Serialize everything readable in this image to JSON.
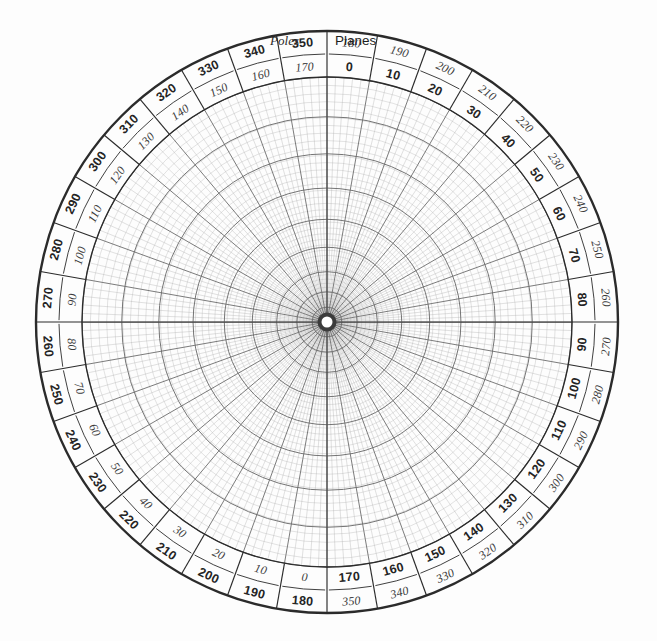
{
  "figure": {
    "kind": "polar-stereographic-net",
    "title_left": "Poles",
    "title_right": "Planes",
    "background_color": "#fdfdfd",
    "ink_color": "#2b2b2b",
    "grid_color": "#6e6e6e",
    "grid_fine_color": "#a8a8a8"
  },
  "geometry": {
    "center_x": 327,
    "center_y": 322,
    "outer_radius": 291,
    "band_inner_radius": 245,
    "hub_radius": 7,
    "label_band_width": 46
  },
  "chart_data": {
    "type": "polar-grid",
    "subtitle": "",
    "xlabel": "",
    "ylabel": "",
    "grid": true,
    "legend_position": "top",
    "scales": [
      {
        "name": "Planes",
        "style": "upright",
        "zero_at_degrees": 0,
        "direction": "clockwise",
        "tick_step": 10,
        "range": [
          0,
          350
        ]
      },
      {
        "name": "Poles",
        "style": "italic",
        "zero_at_degrees": 180,
        "direction": "clockwise",
        "tick_step": 10,
        "range": [
          0,
          350
        ]
      }
    ],
    "radial_lines": {
      "fine_step_degrees": 2,
      "major_step_degrees": 10,
      "count_fine": 180,
      "count_major": 36
    },
    "concentric_circles": {
      "fine_count": 44,
      "major_count": 9,
      "outer_circle_radius": 291,
      "grid_outer_radius": 245
    },
    "tick_labels": [
      {
        "azimuth": 0,
        "planes": "0",
        "poles": "180"
      },
      {
        "azimuth": 10,
        "planes": "10",
        "poles": "190"
      },
      {
        "azimuth": 20,
        "planes": "20",
        "poles": "200"
      },
      {
        "azimuth": 30,
        "planes": "30",
        "poles": "210"
      },
      {
        "azimuth": 40,
        "planes": "40",
        "poles": "220"
      },
      {
        "azimuth": 50,
        "planes": "50",
        "poles": "230"
      },
      {
        "azimuth": 60,
        "planes": "60",
        "poles": "240"
      },
      {
        "azimuth": 70,
        "planes": "70",
        "poles": "250"
      },
      {
        "azimuth": 80,
        "planes": "80",
        "poles": "260"
      },
      {
        "azimuth": 90,
        "planes": "90",
        "poles": "270"
      },
      {
        "azimuth": 100,
        "planes": "100",
        "poles": "280"
      },
      {
        "azimuth": 110,
        "planes": "110",
        "poles": "290"
      },
      {
        "azimuth": 120,
        "planes": "120",
        "poles": "300"
      },
      {
        "azimuth": 130,
        "planes": "130",
        "poles": "310"
      },
      {
        "azimuth": 140,
        "planes": "140",
        "poles": "320"
      },
      {
        "azimuth": 150,
        "planes": "150",
        "poles": "330"
      },
      {
        "azimuth": 160,
        "planes": "160",
        "poles": "340"
      },
      {
        "azimuth": 170,
        "planes": "170",
        "poles": "350"
      },
      {
        "azimuth": 180,
        "planes": "180",
        "poles": "0"
      },
      {
        "azimuth": 190,
        "planes": "190",
        "poles": "10"
      },
      {
        "azimuth": 200,
        "planes": "200",
        "poles": "20"
      },
      {
        "azimuth": 210,
        "planes": "210",
        "poles": "30"
      },
      {
        "azimuth": 220,
        "planes": "220",
        "poles": "40"
      },
      {
        "azimuth": 230,
        "planes": "230",
        "poles": "50"
      },
      {
        "azimuth": 240,
        "planes": "240",
        "poles": "60"
      },
      {
        "azimuth": 250,
        "planes": "250",
        "poles": "70"
      },
      {
        "azimuth": 260,
        "planes": "260",
        "poles": "80"
      },
      {
        "azimuth": 270,
        "planes": "270",
        "poles": "90"
      },
      {
        "azimuth": 280,
        "planes": "280",
        "poles": "100"
      },
      {
        "azimuth": 290,
        "planes": "290",
        "poles": "110"
      },
      {
        "azimuth": 300,
        "planes": "300",
        "poles": "120"
      },
      {
        "azimuth": 310,
        "planes": "310",
        "poles": "130"
      },
      {
        "azimuth": 320,
        "planes": "320",
        "poles": "140"
      },
      {
        "azimuth": 330,
        "planes": "330",
        "poles": "150"
      },
      {
        "azimuth": 340,
        "planes": "340",
        "poles": "160"
      },
      {
        "azimuth": 350,
        "planes": "350",
        "poles": "170"
      }
    ]
  }
}
